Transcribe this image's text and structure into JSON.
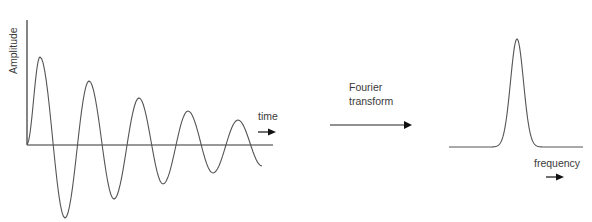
{
  "diagram": {
    "time_domain": {
      "y_axis_label": "Amplitude",
      "x_axis_label": "time",
      "signal": "damped-sine",
      "wave_points": [
        [
          27,
          144
        ],
        [
          40,
          57
        ],
        [
          65,
          218
        ],
        [
          89,
          81
        ],
        [
          114,
          199
        ],
        [
          139,
          98
        ],
        [
          163,
          184
        ],
        [
          188,
          111
        ],
        [
          213,
          173
        ],
        [
          238,
          120
        ],
        [
          262,
          166
        ]
      ],
      "baseline_y": 145
    },
    "transform": {
      "label_line1": "Fourier",
      "label_line2": "transform"
    },
    "frequency_domain": {
      "x_axis_label": "frequency",
      "signal": "single-peak",
      "peak_x": 517,
      "peak_y": 39,
      "baseline_y": 147,
      "x_start": 449,
      "x_end": 583
    },
    "colors": {
      "line": "#555555",
      "arrow": "#111111",
      "text": "#3a3a3a"
    }
  }
}
